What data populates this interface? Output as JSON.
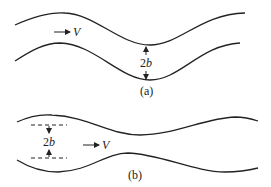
{
  "diagram": {
    "type": "channel-flow-schematic",
    "panels": [
      {
        "id": "a",
        "caption": "(a)",
        "description": "Wavy channel with parallel (in-phase) walls",
        "velocity_label": "V",
        "width_label": "2b",
        "width_label_coefficient": "2",
        "width_label_symbol": "b"
      },
      {
        "id": "b",
        "caption": "(b)",
        "description": "Channel with out-of-phase walls (converging-diverging)",
        "velocity_label": "V",
        "width_label": "2b",
        "width_label_coefficient": "2",
        "width_label_symbol": "b"
      }
    ],
    "colors": {
      "stroke": "#222222",
      "background": "#ffffff"
    }
  }
}
